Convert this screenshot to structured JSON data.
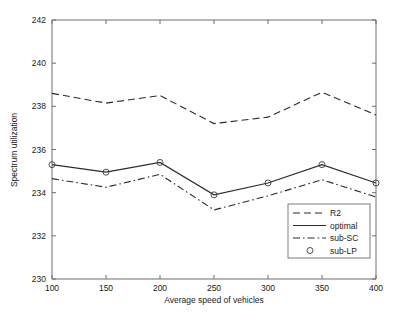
{
  "chart_data": {
    "type": "line",
    "title": "",
    "xlabel": "Average speed of vehicles",
    "ylabel": "Spectrum utilization",
    "x": [
      100,
      150,
      200,
      250,
      300,
      350,
      400
    ],
    "xlim": [
      100,
      400
    ],
    "ylim": [
      230,
      242
    ],
    "xticks": [
      "100",
      "150",
      "200",
      "250",
      "300",
      "350",
      "400"
    ],
    "yticks": [
      "230",
      "232",
      "234",
      "236",
      "238",
      "240",
      "242"
    ],
    "grid": false,
    "legend_position": "lower right",
    "series": [
      {
        "name": "R2",
        "style": "dashed",
        "marker": "none",
        "values": [
          238.6,
          238.15,
          238.5,
          237.2,
          237.5,
          238.65,
          237.6
        ]
      },
      {
        "name": "optimal",
        "style": "solid",
        "marker": "none",
        "values": [
          235.3,
          234.95,
          235.4,
          233.9,
          234.45,
          235.3,
          234.45
        ]
      },
      {
        "name": "sub-SC",
        "style": "dashdot",
        "marker": "none",
        "values": [
          234.65,
          234.25,
          234.85,
          233.2,
          233.85,
          234.6,
          233.8
        ]
      },
      {
        "name": "sub-LP",
        "style": "none",
        "marker": "circle",
        "values": [
          235.3,
          234.95,
          235.4,
          233.9,
          234.45,
          235.3,
          234.45
        ]
      }
    ]
  },
  "figure": {
    "background_color": "#ffffff",
    "axis_color": "#6e6e6e",
    "line_color": "#2b2b2b"
  }
}
